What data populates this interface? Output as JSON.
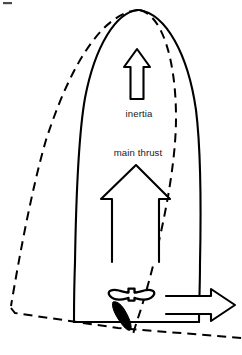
{
  "diagram": {
    "background_color": "#ffffff",
    "ink_color": "#000000",
    "text_color": "#1a1a1a",
    "labels": {
      "inertia": "inertia",
      "main_thrust": "main thrust"
    },
    "elements": {
      "hull_solid_name": "boat-hull-solid",
      "hull_dashed_name": "boat-hull-previous-position-dashed",
      "inertia_arrow_name": "inertia-arrow-up",
      "thrust_arrow_name": "main-thrust-arrow-up",
      "side_arrow_name": "side-force-arrow-right",
      "propeller_name": "propeller-shape",
      "rudder_name": "rudder-blade-filled"
    },
    "stroke_widths": {
      "hull": 2.0,
      "dashed": 2.0,
      "arrow": 2.0,
      "propeller": 2.2
    },
    "dash_pattern": "9 6"
  }
}
